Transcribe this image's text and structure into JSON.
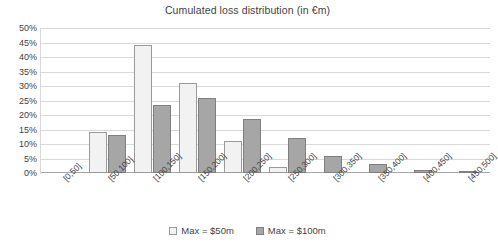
{
  "chart_data": {
    "type": "bar",
    "title": "Cumulated loss distribution (in €m)",
    "xlabel": "",
    "ylabel": "",
    "ylim": [
      0,
      50
    ],
    "ytick_labels": [
      "50%",
      "45%",
      "40%",
      "35%",
      "30%",
      "25%",
      "20%",
      "15%",
      "10%",
      "5%",
      "0%"
    ],
    "ytick_values": [
      50,
      45,
      40,
      35,
      30,
      25,
      20,
      15,
      10,
      5,
      0
    ],
    "grid": true,
    "legend_position": "bottom",
    "categories": [
      "[0,50]",
      "[50,100]",
      "[100,150]",
      "[150,200]",
      "[200,250]",
      "[250,300]",
      "[300,350]",
      "[350,400]",
      "[400,450]",
      "[450,500]"
    ],
    "series": [
      {
        "name": "Max = $50m",
        "color": "#f2f2f2",
        "values": [
          0,
          14,
          44,
          31,
          11,
          2,
          0,
          0,
          0,
          0
        ]
      },
      {
        "name": "Max = $100m",
        "color": "#a6a6a6",
        "values": [
          0,
          13,
          23.5,
          26,
          18.5,
          12,
          6,
          3,
          1,
          0.5
        ]
      }
    ]
  }
}
